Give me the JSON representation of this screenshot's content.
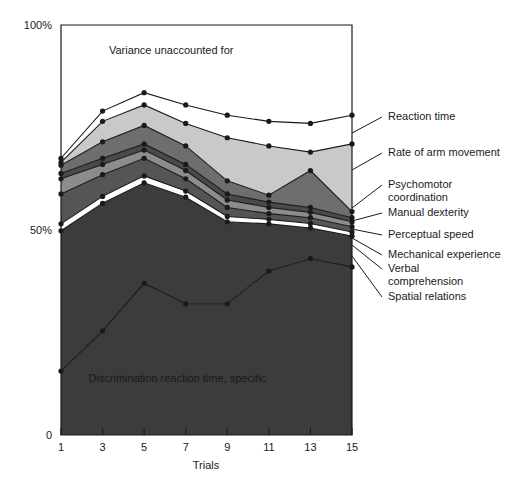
{
  "chart_data": {
    "type": "area",
    "title": "",
    "subtitle": "",
    "xlabel": "Trials",
    "ylabel": "",
    "x": [
      1,
      3,
      5,
      7,
      9,
      11,
      13,
      15
    ],
    "xlim": [
      1,
      15
    ],
    "ylim": [
      0,
      100
    ],
    "xticks": [
      1,
      3,
      5,
      7,
      9,
      11,
      13,
      15
    ],
    "xticklabels": [
      "1",
      "3",
      "5",
      "7",
      "9",
      "11",
      "13",
      "15"
    ],
    "yticks": [
      0,
      50,
      100
    ],
    "yticklabels": [
      "0",
      "50%",
      "100%"
    ],
    "grid": false,
    "legend_position": "right-outside-leader-lines",
    "stacking": "cumulative-from-bottom",
    "annotations": [
      {
        "text": "Variance unaccounted for",
        "x": 6.3,
        "y": 93
      },
      {
        "text": "Discrimination reaction time, specific",
        "x": 6.6,
        "y": 13
      }
    ],
    "series": [
      {
        "name": "Discrimination reaction time, specific",
        "color": "#3c3c3c",
        "cumulative": [
          15.6,
          25.4,
          37.0,
          32.0,
          32.0,
          40.0,
          43.0,
          41.0
        ]
      },
      {
        "name": "Spatial relations",
        "color": "#3c3c3c",
        "cumulative": [
          49.8,
          56.5,
          61.5,
          58.0,
          52.0,
          51.5,
          50.5,
          48.5
        ]
      },
      {
        "name": "Verbal comprehension",
        "color": "#ffffff",
        "cumulative": [
          51.5,
          58.2,
          63.2,
          59.5,
          53.3,
          52.6,
          51.6,
          49.5
        ]
      },
      {
        "name": "Mechanical experience",
        "color": "#555555",
        "cumulative": [
          58.8,
          63.5,
          67.5,
          62.5,
          55.5,
          54.0,
          53.0,
          50.8
        ]
      },
      {
        "name": "Perceptual speed",
        "color": "#8c8c8c",
        "cumulative": [
          62.5,
          66.0,
          69.5,
          64.5,
          57.3,
          55.5,
          54.3,
          52.0
        ]
      },
      {
        "name": "Manual dexterity",
        "color": "#4a4a4a",
        "cumulative": [
          63.8,
          67.5,
          71.0,
          66.0,
          58.8,
          56.8,
          55.5,
          53.0
        ]
      },
      {
        "name": "Psychomotor coordination",
        "color": "#6e6e6e",
        "cumulative": [
          65.8,
          71.5,
          75.5,
          70.5,
          62.0,
          58.5,
          64.5,
          54.5
        ]
      },
      {
        "name": "Rate of arm movement",
        "color": "#c9c9c9",
        "cumulative": [
          66.5,
          76.5,
          80.5,
          76.0,
          72.5,
          70.5,
          69.0,
          71.0
        ]
      },
      {
        "name": "Reaction time",
        "color": "#ffffff",
        "cumulative": [
          67.5,
          79.0,
          83.5,
          80.5,
          78.0,
          76.5,
          76.0,
          78.0
        ]
      }
    ],
    "labels": [
      {
        "key": "reaction-time",
        "text": "Reaction time",
        "text_x": 388,
        "text_y": 120,
        "leader_from_x": 352,
        "leader_from_y": 133,
        "leader_to_x": 382,
        "leader_to_y": 117
      },
      {
        "key": "rate-of-arm-movement",
        "text": "Rate of arm movement",
        "text_x": 388,
        "text_y": 156,
        "leader_from_x": 352,
        "leader_from_y": 170,
        "leader_to_x": 382,
        "leader_to_y": 153
      },
      {
        "key": "psychomotor-coordination",
        "text": "Psychomotor",
        "text2": "coordination",
        "text_x": 388,
        "text_y": 188,
        "leader_from_x": 352,
        "leader_from_y": 208,
        "leader_to_x": 382,
        "leader_to_y": 185
      },
      {
        "key": "manual-dexterity",
        "text": "Manual dexterity",
        "text_x": 388,
        "text_y": 216,
        "leader_from_x": 352,
        "leader_from_y": 221,
        "leader_to_x": 382,
        "leader_to_y": 213
      },
      {
        "key": "perceptual-speed",
        "text": "Perceptual speed",
        "text_x": 388,
        "text_y": 238,
        "leader_from_x": 352,
        "leader_from_y": 229,
        "leader_to_x": 382,
        "leader_to_y": 235
      },
      {
        "key": "mechanical-experience",
        "text": "Mechanical experience",
        "text_x": 388,
        "text_y": 258,
        "leader_from_x": 352,
        "leader_from_y": 238,
        "leader_to_x": 382,
        "leader_to_y": 255
      },
      {
        "key": "verbal-comprehension",
        "text": "Verbal",
        "text2": "comprehension",
        "text_x": 388,
        "text_y": 272,
        "leader_from_x": 352,
        "leader_from_y": 245,
        "leader_to_x": 382,
        "leader_to_y": 269
      },
      {
        "key": "spatial-relations",
        "text": "Spatial relations",
        "text_x": 388,
        "text_y": 300,
        "leader_from_x": 352,
        "leader_from_y": 256,
        "leader_to_x": 382,
        "leader_to_y": 297
      }
    ]
  },
  "axes": {
    "y_top_label": "100%",
    "y_mid_label": "50%",
    "y_bottom_label": "0",
    "x_title": "Trials"
  },
  "colors": {
    "frame": "#1a1a1a",
    "marker": "#1a1a1a",
    "line": "#1a1a1a",
    "background": "#ffffff"
  }
}
